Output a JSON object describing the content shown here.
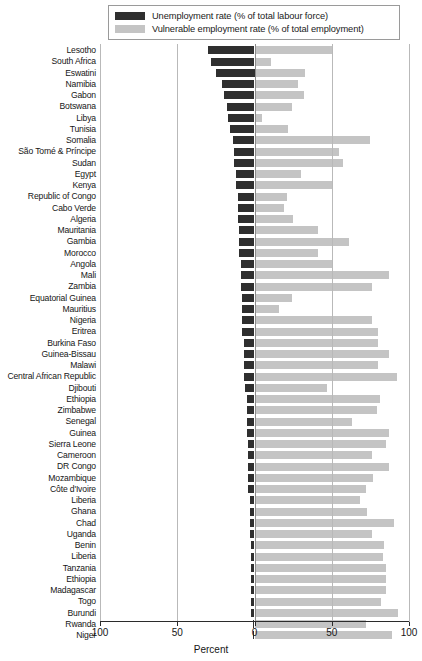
{
  "legend": {
    "items": [
      {
        "key": "unemployment",
        "label": "Unemployment rate (% of total labour force)",
        "color": "#2f2f2f",
        "swatch_name": "legend-swatch-unemployment"
      },
      {
        "key": "vulnerable",
        "label": "Vulnerable employment rate (% of total employment)",
        "color": "#c4c4c4",
        "swatch_name": "legend-swatch-vulnerable"
      }
    ]
  },
  "axis": {
    "title": "Percent",
    "tick_labels": [
      "100",
      "50",
      "0",
      "50",
      "100"
    ],
    "tick_values": [
      -100,
      -50,
      0,
      50,
      100
    ]
  },
  "chart_data": {
    "type": "bar",
    "orientation": "horizontal",
    "layout": "diverging",
    "title": "",
    "xlabel": "Percent",
    "ylabel": "",
    "xlim": [
      -100,
      100
    ],
    "grid": true,
    "legend_position": "top",
    "categories": [
      "Lesotho",
      "South Africa",
      "Eswatini",
      "Namibia",
      "Gabon",
      "Botswana",
      "Libya",
      "Tunisia",
      "Somalia",
      "São Tomé & Príncipe",
      "Sudan",
      "Egypt",
      "Kenya",
      "Republic of Congo",
      "Cabo Verde",
      "Algeria",
      "Mauritania",
      "Gambia",
      "Morocco",
      "Angola",
      "Mali",
      "Zambia",
      "Equatorial Guinea",
      "Mauritius",
      "Nigeria",
      "Eritrea",
      "Burkina Faso",
      "Guinea-Bissau",
      "Malawi",
      "Central African Republic",
      "Djibouti",
      "Ethiopia",
      "Zimbabwe",
      "Senegal",
      "Guinea",
      "Sierra Leone",
      "Cameroon",
      "DR Congo",
      "Mozambique",
      "Côte d'Ivoire",
      "Liberia",
      "Ghana",
      "Chad",
      "Uganda",
      "Benin",
      "Liberia",
      "Tanzania",
      "Ethiopia",
      "Madagascar",
      "Togo",
      "Burundi",
      "Rwanda",
      "Niger"
    ],
    "series": [
      {
        "name": "Unemployment rate (% of total labour force)",
        "direction": "left",
        "color": "#2f2f2f",
        "values": [
          30,
          28,
          25,
          21,
          20,
          18,
          17,
          16,
          14,
          13,
          13,
          12,
          12,
          11,
          11,
          11,
          10,
          10,
          10,
          9,
          9,
          9,
          8,
          8,
          8,
          8,
          7,
          7,
          7,
          7,
          6,
          5,
          5,
          5,
          5,
          4,
          4,
          4,
          4,
          4,
          3,
          3,
          3,
          3,
          2,
          2,
          2,
          2,
          2,
          2,
          2,
          1,
          1
        ]
      },
      {
        "name": "Vulnerable employment rate (% of total employment)",
        "direction": "right",
        "color": "#c4c4c4",
        "values": [
          51,
          11,
          33,
          28,
          32,
          24,
          5,
          22,
          75,
          55,
          57,
          30,
          50,
          21,
          19,
          25,
          41,
          61,
          41,
          51,
          87,
          76,
          24,
          16,
          76,
          80,
          80,
          87,
          80,
          92,
          47,
          81,
          79,
          63,
          87,
          85,
          76,
          87,
          77,
          72,
          68,
          73,
          90,
          76,
          84,
          83,
          85,
          85,
          85,
          82,
          93,
          72,
          89
        ]
      }
    ]
  }
}
